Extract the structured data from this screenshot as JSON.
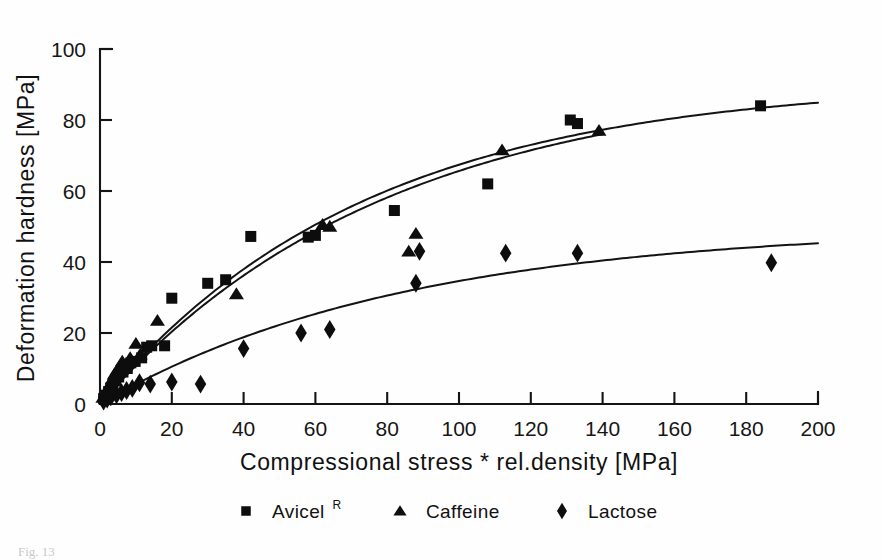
{
  "figure": {
    "caption_partial": "Fig. 13",
    "y_axis_label": "Deformation hardness [MPa]",
    "x_axis_label": "Compressional stress * rel.density [MPa]"
  },
  "legend": {
    "position": "bottom-center",
    "entries": [
      {
        "marker": "square-marker",
        "label": "Avicel",
        "superscript": "R"
      },
      {
        "marker": "triangle-marker",
        "label": "Caffeine",
        "superscript": ""
      },
      {
        "marker": "diamond-marker",
        "label": "Lactose",
        "superscript": ""
      }
    ]
  },
  "chart_data": {
    "type": "scatter",
    "title": "",
    "subtitle": "",
    "xlabel": "Compressional stress * rel.density [MPa]",
    "ylabel": "Deformation hardness [MPa]",
    "xlim": [
      0,
      200
    ],
    "ylim": [
      0,
      100
    ],
    "xticks": [
      0,
      20,
      40,
      60,
      80,
      100,
      120,
      140,
      160,
      180,
      200
    ],
    "yticks": [
      0,
      20,
      40,
      60,
      80,
      100
    ],
    "grid": false,
    "legend_position": "below-axes",
    "annotations": [],
    "series": [
      {
        "name": "Avicel",
        "marker": "square",
        "color": "#0d0d0d",
        "points": [
          [
            1.0,
            1.5
          ],
          [
            1.8,
            2.5
          ],
          [
            2.4,
            3.5
          ],
          [
            3.0,
            4.5
          ],
          [
            3.6,
            5.5
          ],
          [
            4.4,
            6.5
          ],
          [
            5.2,
            7.6
          ],
          [
            6.4,
            9.0
          ],
          [
            7.6,
            10.0
          ],
          [
            8.6,
            11.6
          ],
          [
            9.8,
            12.0
          ],
          [
            11.6,
            13.0
          ],
          [
            13.0,
            16.0
          ],
          [
            14.4,
            16.4
          ],
          [
            18.0,
            16.4
          ],
          [
            20.0,
            29.8
          ],
          [
            30.0,
            34.0
          ],
          [
            35.0,
            35.0
          ],
          [
            42.0,
            47.2
          ],
          [
            58.0,
            47.0
          ],
          [
            60.0,
            47.5
          ],
          [
            82.0,
            54.5
          ],
          [
            108.0,
            62.0
          ],
          [
            131.0,
            80.0
          ],
          [
            133.0,
            79.0
          ],
          [
            184.0,
            84.0
          ]
        ]
      },
      {
        "name": "Caffeine",
        "marker": "triangle",
        "color": "#0d0d0d",
        "points": [
          [
            0.8,
            1.8
          ],
          [
            1.5,
            3.0
          ],
          [
            2.2,
            4.2
          ],
          [
            2.8,
            5.6
          ],
          [
            3.4,
            7.0
          ],
          [
            4.0,
            8.4
          ],
          [
            4.8,
            9.6
          ],
          [
            5.6,
            10.8
          ],
          [
            6.2,
            12.0
          ],
          [
            7.0,
            11.0
          ],
          [
            8.4,
            13.0
          ],
          [
            10.0,
            17.0
          ],
          [
            11.2,
            14.0
          ],
          [
            16.0,
            23.5
          ],
          [
            38.0,
            31.0
          ],
          [
            62.0,
            50.5
          ],
          [
            64.0,
            50.0
          ],
          [
            86.0,
            43.0
          ],
          [
            88.0,
            48.0
          ],
          [
            112.0,
            71.5
          ],
          [
            139.0,
            77.0
          ]
        ]
      },
      {
        "name": "Lactose",
        "marker": "diamond",
        "color": "#0d0d0d",
        "points": [
          [
            1.0,
            0.8
          ],
          [
            2.0,
            1.4
          ],
          [
            3.0,
            2.0
          ],
          [
            4.6,
            2.6
          ],
          [
            6.0,
            3.2
          ],
          [
            7.4,
            3.8
          ],
          [
            9.0,
            4.4
          ],
          [
            11.0,
            6.0
          ],
          [
            14.0,
            5.6
          ],
          [
            20.0,
            6.2
          ],
          [
            28.0,
            5.6
          ],
          [
            40.0,
            15.6
          ],
          [
            56.0,
            20.0
          ],
          [
            64.0,
            21.0
          ],
          [
            88.0,
            34.0
          ],
          [
            89.0,
            43.0
          ],
          [
            113.0,
            42.5
          ],
          [
            133.0,
            42.5
          ],
          [
            187.0,
            39.8
          ]
        ]
      }
    ],
    "fit_curves": [
      {
        "name": "Avicel fit",
        "model": "saturating exponential",
        "plateau": 91,
        "rate": 0.0135,
        "x_range": [
          0,
          200
        ]
      },
      {
        "name": "Caffeine fit",
        "model": "saturating exponential",
        "plateau": 92,
        "rate": 0.0125,
        "x_range": [
          0,
          140
        ]
      },
      {
        "name": "Lactose fit",
        "model": "saturating exponential",
        "plateau": 50,
        "rate": 0.0118,
        "x_range": [
          0,
          200
        ]
      }
    ]
  }
}
